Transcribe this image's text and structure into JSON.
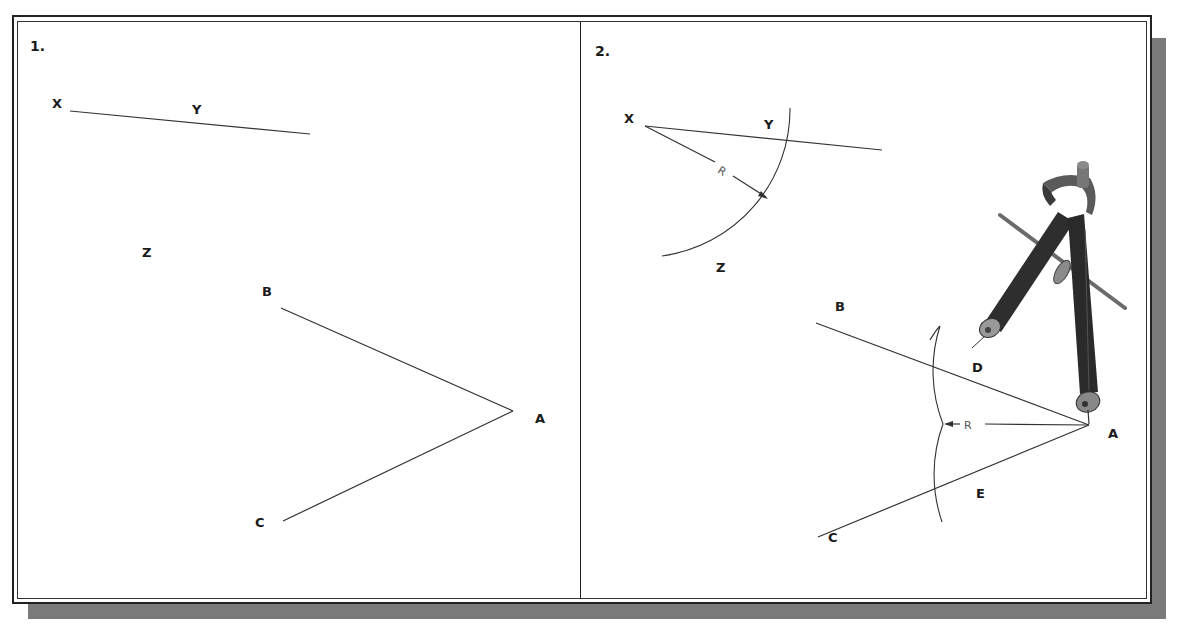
{
  "figure": {
    "colors": {
      "line": "#333333",
      "frame": "#222222",
      "shadow": "#7a7a7a",
      "compass": "#2e2e2e",
      "background": "#ffffff"
    }
  },
  "panel1": {
    "step_label": "1.",
    "points": {
      "X": "X",
      "Y": "Y",
      "Z": "Z",
      "A": "A",
      "B": "B",
      "C": "C"
    }
  },
  "panel2": {
    "step_label": "2.",
    "points": {
      "X": "X",
      "Y": "Y",
      "Z": "Z",
      "A": "A",
      "B": "B",
      "C": "C",
      "D": "D",
      "E": "E"
    },
    "radius_label_top": "R",
    "radius_label_bottom": "R",
    "tool_icon": "compass-icon"
  }
}
